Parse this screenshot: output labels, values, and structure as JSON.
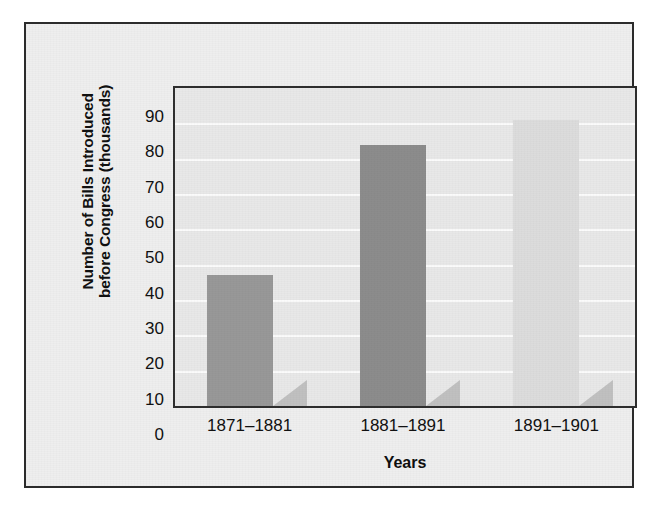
{
  "figure": {
    "background_color": "#eeeeee",
    "frame_border_color": "#2b2b2b",
    "plot_background_color": "#e8e8e8",
    "gridline_color": "#fbfbfb"
  },
  "chart_data": {
    "type": "bar",
    "title": "",
    "subtitle": "",
    "xlabel": "Years",
    "ylabel_line1": "Number of Bills Introduced",
    "ylabel_line2": "before Congress (thousands)",
    "ylabel": "Number of Bills Introduced before Congress (thousands)",
    "categories": [
      "1871–1881",
      "1881–1891",
      "1891–1901"
    ],
    "values": [
      37,
      74,
      81
    ],
    "bar_colors": [
      "#989898",
      "#8c8c8c",
      "#dcdcdc"
    ],
    "ylim": [
      0,
      90
    ],
    "ytick_values": [
      0,
      10,
      20,
      30,
      40,
      50,
      60,
      70,
      80,
      90
    ],
    "ytick_labels": [
      "0",
      "10",
      "20",
      "30",
      "40",
      "50",
      "60",
      "70",
      "80",
      "90"
    ],
    "grid": true,
    "grid_axis": "y",
    "legend": false,
    "legend_position": "none",
    "shadow": true
  }
}
